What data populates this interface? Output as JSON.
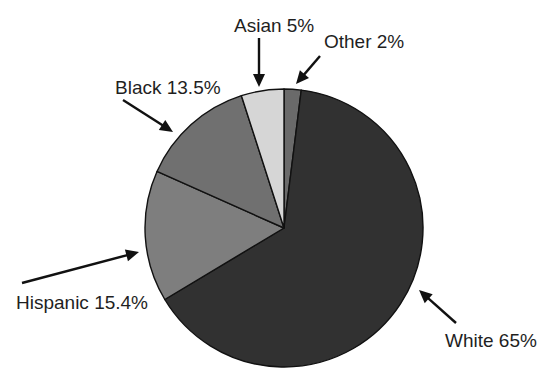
{
  "chart_data": {
    "type": "pie",
    "title": "",
    "categories": [
      "Other",
      "White",
      "Hispanic",
      "Black",
      "Asian"
    ],
    "values": [
      2,
      65,
      15.4,
      13.5,
      5
    ],
    "unit": "%",
    "start_angle_deg": 0,
    "direction": "clockwise",
    "colors": [
      "#6a6a6a",
      "#313131",
      "#7e7e7e",
      "#707070",
      "#d6d6d6"
    ],
    "labels": [
      {
        "name": "Other",
        "text": "Other 2%"
      },
      {
        "name": "White",
        "text": "White 65%"
      },
      {
        "name": "Hispanic",
        "text": "Hispanic 15.4%"
      },
      {
        "name": "Black",
        "text": "Black 13.5%"
      },
      {
        "name": "Asian",
        "text": "Asian 5%"
      }
    ],
    "legend": "none (callout labels with arrows)",
    "grid": false
  },
  "layout": {
    "cx": 284,
    "cy": 228,
    "r": 139,
    "callouts": [
      {
        "label_x": 324,
        "label_y": 48,
        "anchor": "start",
        "from": [
          320,
          56
        ],
        "to": [
          296,
          84
        ]
      },
      {
        "label_x": 445,
        "label_y": 347,
        "anchor": "start",
        "from": [
          456,
          323
        ],
        "to": [
          419,
          290
        ]
      },
      {
        "label_x": 16,
        "label_y": 309,
        "anchor": "start",
        "from": [
          22,
          283
        ],
        "to": [
          139,
          252
        ]
      },
      {
        "label_x": 115,
        "label_y": 94,
        "anchor": "start",
        "from": [
          123,
          100
        ],
        "to": [
          173,
          132
        ]
      },
      {
        "label_x": 234,
        "label_y": 32,
        "anchor": "start",
        "from": [
          259,
          38
        ],
        "to": [
          259,
          87
        ]
      }
    ]
  }
}
